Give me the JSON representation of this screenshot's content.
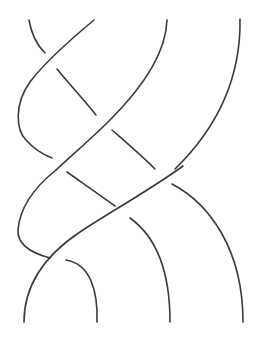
{
  "diagram": {
    "type": "braid-knot",
    "stroke_color": "#3a3a3a",
    "background": "#ffffff",
    "strands": [
      {
        "id": "s1",
        "d": "M29,20 C31,32 36,44 45,53"
      },
      {
        "id": "s2",
        "d": "M94,20 C70,40 45,62 30,82 C14,104 16,130 26,140 C34,149 44,155 52,158"
      },
      {
        "id": "s3",
        "d": "M57,69 C70,85 84,100 96,115"
      },
      {
        "id": "s4",
        "d": "M167,20 C166,55 140,90 110,120 C92,138 72,155 56,170"
      },
      {
        "id": "s5",
        "d": "M112,130 C128,144 142,156 155,169"
      },
      {
        "id": "s6",
        "d": "M240,19 C241,80 215,130 175,169"
      },
      {
        "id": "s7",
        "d": "M56,170 C36,186 20,205 18,230 C17,246 35,254 50,258"
      },
      {
        "id": "s8",
        "d": "M67,172 C84,184 100,195 115,206"
      },
      {
        "id": "s9",
        "d": "M183,166 C150,190 110,212 80,232 C50,252 24,280 24,322"
      },
      {
        "id": "s10",
        "d": "M172,184 C210,204 243,250 243,322"
      },
      {
        "id": "s11",
        "d": "M130,218 C158,238 170,275 170,322"
      },
      {
        "id": "s12",
        "d": "M66,260 C90,264 98,290 97,322"
      }
    ]
  }
}
